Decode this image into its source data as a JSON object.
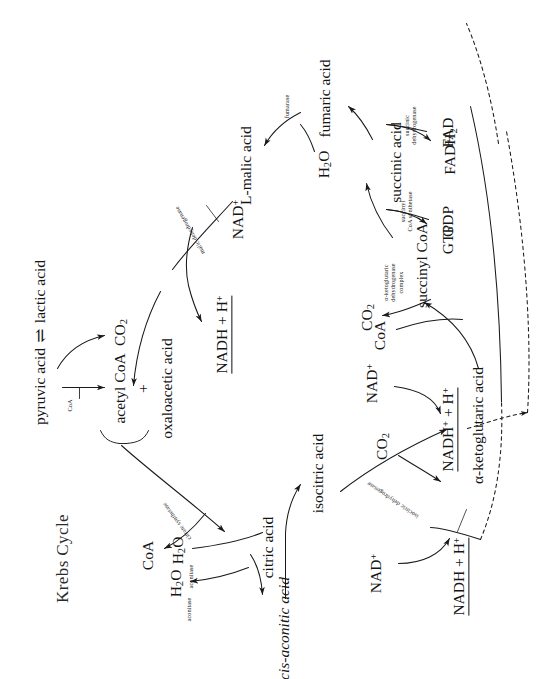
{
  "diagram": {
    "title": "Krebs Cycle",
    "type": "metabolic-pathway",
    "orientation": "rotated-90-ccw",
    "background": "#ffffff",
    "ink": "#151515"
  },
  "metabolites": {
    "lactic_acid": "lactic acid",
    "pyruvic_acid": "pyruvic acid",
    "co2_pyruvate": "CO",
    "co2_pyruvate_sub": "2",
    "acetyl_coa": "acetyl CoA",
    "plus": "+",
    "oxaloacetic_acid": "oxaloacetic acid",
    "citric_acid": "citric acid",
    "coa_released": "CoA",
    "h2o_out_aconitase": "H",
    "h2o_out_aconitase_sub": "2",
    "h2o_out_aconitase_tail": "O",
    "cis_aconitic_acid": "cis-aconitic acid",
    "h2o_in_aconitase": "H",
    "h2o_in_aconitase_sub": "2",
    "h2o_in_aconitase_tail": "O",
    "isocitric_acid": "isocitric acid",
    "nad_isocitric": "NAD",
    "nad_isocitric_sup": "+",
    "nadh_isocitric": "NADH + H",
    "nadh_isocitric_sup": "+",
    "co2_isocitric": "CO",
    "co2_isocitric_sub": "2",
    "alpha_ketoglutaric_acid": "α-ketoglutaric acid",
    "coa_akg": "CoA",
    "co2_akg": "CO",
    "co2_akg_sub": "2",
    "nad_akg": "NAD",
    "nad_akg_sup": "+",
    "nadh_akg": "NADH",
    "nadh_akg_sup1": "+",
    "nadh_akg_mid": " + H",
    "nadh_akg_sup2": "+",
    "succinyl_coa": "succinyl CoA",
    "gdp": "GDP",
    "gtp": "GTP",
    "succinic_acid": "succinic acid",
    "fad": "FAD",
    "fadh2": "FADH",
    "fadh2_sub": "2",
    "fumaric_acid": "fumaric acid",
    "h2o_fumarase": "H",
    "h2o_fumarase_sub": "2",
    "h2o_fumarase_tail": "O",
    "l_malic_acid": "L-malic acid",
    "nad_malic": "NAD",
    "nad_malic_sup": "+",
    "nadh_malic": "NADH + H",
    "nadh_malic_sup": "+"
  },
  "enzymes": {
    "coa_small": "CoA",
    "citrate_synthetase": "citrate synthetase",
    "aconitase_1": "aconitase",
    "aconitase_2": "aconitase",
    "isocitric_dehydrogenase": "isocitric dehydrogenase",
    "akg_complex_line1": "α-ketoglutaric",
    "akg_complex_line2": "dehydrogenase",
    "akg_complex_line3": "complex",
    "succinyl_coa_synthetase_line1": "succinyl",
    "succinyl_coa_synthetase_line2": "CoA synthetase",
    "succinic_dehydrogenase_line1": "succinic",
    "succinic_dehydrogenase_line2": "dehydrogenase",
    "fumarase": "fumarase",
    "malic_dehydrogenase": "malic dehydrogenase"
  },
  "symbols": {
    "equilibrium": "⇌"
  }
}
